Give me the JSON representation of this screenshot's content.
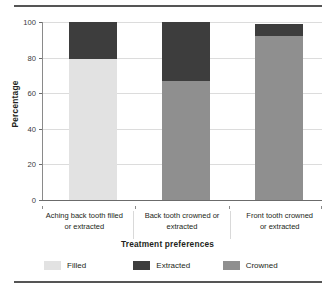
{
  "chart_data": {
    "type": "bar",
    "subtype": "stacked-bar",
    "title": "",
    "xlabel": "Treatment preferences",
    "ylabel": "Percentage",
    "ylim": [
      0,
      100
    ],
    "yticks": [
      0,
      20,
      40,
      60,
      80,
      100
    ],
    "ytick_labels": [
      "0",
      "20",
      "40",
      "60",
      "80",
      "100"
    ],
    "grid": "horizontal",
    "legend_position": "bottom",
    "categories": [
      "Aching back tooth filled or extracted",
      "Back tooth crowned or extracted",
      "Front tooth crowned or extracted"
    ],
    "category_lines": [
      [
        "Aching back tooth filled",
        "or extracted"
      ],
      [
        "Back tooth crowned or",
        "extracted"
      ],
      [
        "Front tooth crowned",
        "or extracted"
      ]
    ],
    "series": [
      {
        "name": "Filled",
        "color": "#e2e2e2",
        "values": [
          79,
          0,
          0
        ]
      },
      {
        "name": "Extracted",
        "color": "#3d3d3d",
        "values": [
          21,
          33,
          7
        ]
      },
      {
        "name": "Crowned",
        "color": "#8f8f8f",
        "values": [
          0,
          67,
          92
        ]
      }
    ],
    "stack_order": [
      "Filled",
      "Crowned",
      "Extracted"
    ],
    "totals": [
      100,
      100,
      99
    ]
  },
  "legend": {
    "entries": [
      {
        "label": "Filled",
        "color": "#e2e2e2"
      },
      {
        "label": "Extracted",
        "color": "#3d3d3d"
      },
      {
        "label": "Crowned",
        "color": "#8f8f8f"
      }
    ]
  },
  "axes": {
    "y_title": "Percentage",
    "x_title": "Treatment preferences"
  }
}
